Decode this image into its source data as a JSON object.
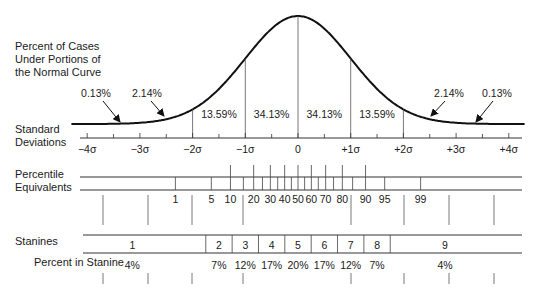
{
  "labels": {
    "curve_title": [
      "Percent of Cases",
      "Under Portions of",
      "the Normal Curve"
    ],
    "std_dev": [
      "Standard",
      "Deviations"
    ],
    "percentile": [
      "Percentile",
      "Equivalents"
    ],
    "stanines": "Stanines",
    "percent_in_stanine": "Percent in Stanine"
  },
  "chart_data": {
    "type": "area",
    "title": "Percent of Cases Under Portions of the Normal Curve",
    "xlabel": "Standard Deviations",
    "x_ticks": [
      "−4σ",
      "−3σ",
      "−2σ",
      "−1σ",
      "0",
      "+1σ",
      "+2σ",
      "+3σ",
      "+4σ"
    ],
    "xlim": [
      -4,
      4
    ],
    "grid": false,
    "regions": [
      {
        "from": -4,
        "to": -3,
        "percent": "0.13%"
      },
      {
        "from": -3,
        "to": -2,
        "percent": "2.14%"
      },
      {
        "from": -2,
        "to": -1,
        "percent": "13.59%"
      },
      {
        "from": -1,
        "to": 0,
        "percent": "34.13%"
      },
      {
        "from": 0,
        "to": 1,
        "percent": "34.13%"
      },
      {
        "from": 1,
        "to": 2,
        "percent": "13.59%"
      },
      {
        "from": 2,
        "to": 3,
        "percent": "2.14%"
      },
      {
        "from": 3,
        "to": 4,
        "percent": "0.13%"
      }
    ],
    "percentile_equivalents": [
      "1",
      "5",
      "10",
      "20",
      "30",
      "40",
      "50",
      "60",
      "70",
      "80",
      "90",
      "95",
      "99"
    ],
    "stanines": [
      {
        "stanine": "1",
        "percent": "4%"
      },
      {
        "stanine": "2",
        "percent": "7%"
      },
      {
        "stanine": "3",
        "percent": "12%"
      },
      {
        "stanine": "4",
        "percent": "17%"
      },
      {
        "stanine": "5",
        "percent": "20%"
      },
      {
        "stanine": "6",
        "percent": "17%"
      },
      {
        "stanine": "7",
        "percent": "12%"
      },
      {
        "stanine": "8",
        "percent": "7%"
      },
      {
        "stanine": "9",
        "percent": "4%"
      }
    ]
  }
}
